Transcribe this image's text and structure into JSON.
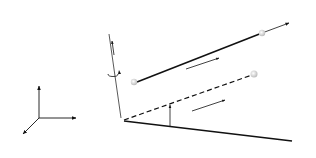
{
  "diagram": {
    "axes": {
      "z_label": "z",
      "y_label": "y",
      "x_label": "x"
    },
    "points": {
      "A": "A",
      "A_prime": "A′",
      "B": "B",
      "B_prime": "B′"
    },
    "vectors": {
      "x_hat_a": "x̂",
      "x_hat_a_sub": "a",
      "x_hat_b": "x̂",
      "x_hat_b_sub": "b",
      "e_ba": "e",
      "e_ba_sub": "ba",
      "e_a_line": "ẽ",
      "e_a_line_sub": "a",
      "e_a_line_sup": "0",
      "e_b_line": "ẽ",
      "e_b_line_sub": "a",
      "e_b_line_sup": "b",
      "e_dashed": "ẽ",
      "e_dashed_sub": "a",
      "e_dashed_sup": "b"
    },
    "params": {
      "theta_ba_left": "θ",
      "theta_ba_left_sub": "ba",
      "theta_ba_angle": "θ",
      "theta_ba_angle_sub": "ba",
      "t_a": "t",
      "t_a_sub": "a",
      "t_b": "t",
      "t_b_sub": "b",
      "delta_beta": "Δβ̂",
      "delta_beta_sub": "a",
      "delta_beta_sup": "A"
    },
    "colors": {
      "line": "#111111",
      "node": "#d9d9d9",
      "text": "#222222"
    }
  }
}
